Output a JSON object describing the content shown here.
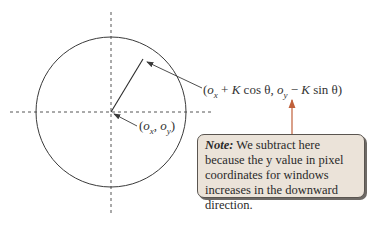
{
  "diagram": {
    "type": "circle-coordinate-diagram",
    "center_label": {
      "open": "(",
      "ox_base": "o",
      "ox_sub": "x",
      "sep": ", ",
      "oy_base": "o",
      "oy_sub": "y",
      "close": ")"
    },
    "point_label": {
      "p1": "(",
      "ox_base": "o",
      "ox_sub": "x",
      "p2": " + ",
      "K1": "K",
      "p3": " cos θ, ",
      "oy_base": "o",
      "oy_sub": "y",
      "p4": " − ",
      "K2": "K",
      "p5": " sin θ)"
    },
    "note": {
      "title": "Note:",
      "text": " We subtract here because the y value in pixel coordinates for windows increases in the downward direction."
    },
    "colors": {
      "line": "#3a3a3a",
      "dashed_axis": "#555555",
      "note_arrow": "#c0603a",
      "note_fill": "#ebe3d9",
      "note_border": "#5a5550"
    },
    "geometry": {
      "circle_center": [
        111,
        112
      ],
      "circle_radius": 75,
      "radius_endpoint": [
        143,
        59
      ]
    }
  }
}
